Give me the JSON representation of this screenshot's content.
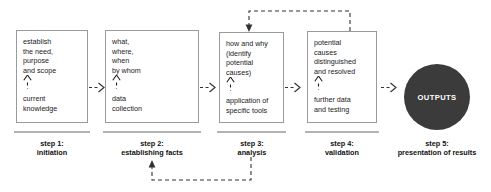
{
  "diagram": {
    "colors": {
      "box_border": "#9a9a9a",
      "underline_bar": "#b3b3b3",
      "circle_fill": "#3b3b3b",
      "circle_text": "#ffffff",
      "text": "#1a1a1a",
      "arrow": "#333333"
    },
    "steps": [
      {
        "id": "step-1",
        "top_text": "establish\nthe need,\npurpose\nand scope",
        "bottom_text": "current\nknowledge",
        "caption": "step 1:\ninitiation"
      },
      {
        "id": "step-2",
        "top_text": "what,\nwhere,\nwhen\nby whom",
        "bottom_text": "data\ncollection",
        "caption": "step 2:\nestablishing facts"
      },
      {
        "id": "step-3",
        "top_text": "how and why\n(identify\npotential\ncauses)",
        "bottom_text": "application of\nspecific tools",
        "caption": "step 3:\nanalysis"
      },
      {
        "id": "step-4",
        "top_text": "potential\ncauses\ndistinguished\nand resolved",
        "bottom_text": "further data\nand testing",
        "caption": "step 4:\nvalidation"
      }
    ],
    "output": {
      "label": "OUTPUTS",
      "caption": "step 5:\npresentation of results"
    },
    "connectors": [
      {
        "id": "arrow-step1-step2",
        "style": "dashed"
      },
      {
        "id": "arrow-step2-step3",
        "style": "dashed"
      },
      {
        "id": "arrow-step3-step4",
        "style": "dashed"
      },
      {
        "id": "arrow-step4-outputs",
        "style": "dashed"
      }
    ],
    "feedback_loops": [
      {
        "id": "feedback-step4-to-step3",
        "style": "dashed",
        "position": "top"
      },
      {
        "id": "feedback-step3-to-step2",
        "style": "dashed",
        "position": "bottom"
      }
    ]
  }
}
